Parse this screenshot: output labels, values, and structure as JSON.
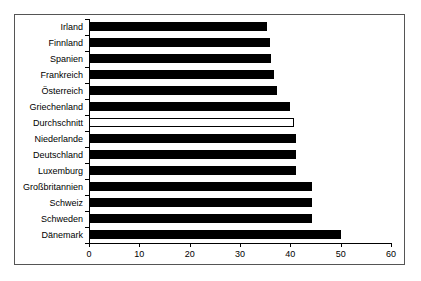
{
  "chart_data": {
    "type": "bar",
    "orientation": "horizontal",
    "title": "",
    "subtitle": "",
    "xlabel": "",
    "ylabel": "",
    "xlim": [
      0,
      60
    ],
    "xticks": [
      0,
      10,
      20,
      30,
      40,
      50,
      60
    ],
    "xtick_labels": [
      "0",
      "10",
      "20",
      "30",
      "40",
      "50",
      "60"
    ],
    "grid": false,
    "legend": null,
    "categories": [
      "Irland",
      "Finnland",
      "Spanien",
      "Frankreich",
      "Österreich",
      "Griechenland",
      "Durchschnitt",
      "Niederlande",
      "Deutschland",
      "Luxemburg",
      "Großbritannien",
      "Schweiz",
      "Schweden",
      "Dänemark"
    ],
    "values": [
      35.4,
      36.0,
      36.2,
      36.8,
      37.4,
      39.9,
      40.7,
      41.1,
      41.1,
      41.1,
      44.3,
      44.3,
      44.3,
      50.1
    ],
    "bar_styles": [
      "filled",
      "filled",
      "filled",
      "filled",
      "filled",
      "filled",
      "hollow",
      "filled",
      "filled",
      "filled",
      "filled",
      "filled",
      "filled",
      "filled"
    ],
    "colors": {
      "bar_fill": "#000000",
      "bar_hollow_fill": "#ffffff",
      "bar_outline": "#000000",
      "axis": "#000000",
      "frame": "#555555",
      "background": "#ffffff"
    }
  }
}
